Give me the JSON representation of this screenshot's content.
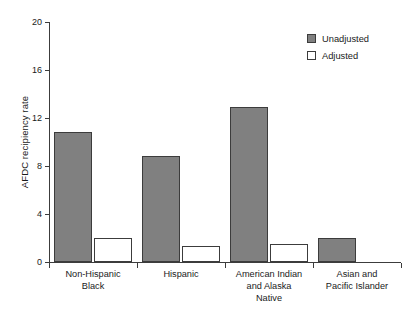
{
  "chart_data": {
    "type": "bar",
    "title": "",
    "subtitle": "",
    "xlabel": "",
    "ylabel": "AFDC recipiency rate",
    "ylim": [
      0,
      20
    ],
    "yticks": [
      0,
      4,
      8,
      12,
      16,
      20
    ],
    "ytick_labels": [
      "0",
      "4",
      "8",
      "12",
      "16",
      "20"
    ],
    "grid": false,
    "legend_position": "top-right",
    "categories": [
      "Non-Hispanic\nBlack",
      "Hispanic",
      "American Indian\nand Alaska\nNative",
      "Asian and\nPacific Islander"
    ],
    "category_lines": [
      [
        "Non-Hispanic",
        "Black"
      ],
      [
        "Hispanic"
      ],
      [
        "American Indian",
        "and Alaska",
        "Native"
      ],
      [
        "Asian and",
        "Pacific Islander"
      ]
    ],
    "series": [
      {
        "name": "Unadjusted",
        "color": "#808080",
        "values": [
          10.8,
          8.8,
          12.9,
          2.0
        ]
      },
      {
        "name": "Adjusted",
        "color": "#ffffff",
        "values": [
          2.0,
          1.3,
          1.5,
          0
        ]
      }
    ],
    "axis_color": "#3c3c3c",
    "bar_edge_color": "#3c3c3c"
  },
  "legend": {
    "items": [
      {
        "label": "Unadjusted",
        "swatch": "filled-gray-swatch-icon"
      },
      {
        "label": "Adjusted",
        "swatch": "empty-white-swatch-icon"
      }
    ]
  }
}
